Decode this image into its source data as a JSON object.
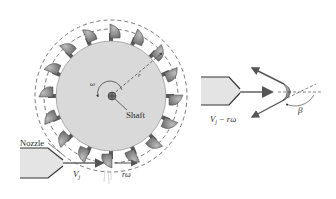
{
  "diagram": {
    "labels": {
      "omega": "ω",
      "radius": "r",
      "shaft": "Shaft",
      "nozzle": "Nozzle",
      "jet_velocity": "V",
      "jet_velocity_sub": "j",
      "bucket_speed": "rω",
      "relative_velocity": "V",
      "relative_velocity_sub": "j",
      "relative_velocity_suffix": " − rω",
      "beta": "β"
    },
    "colors": {
      "disk": "#d9d9d9",
      "bucket": "#8a8a8a",
      "outline": "#3a3a3a",
      "arrow": "#555555",
      "nozzle_fill": "#e4e4e4"
    },
    "bucket_count": 16
  }
}
